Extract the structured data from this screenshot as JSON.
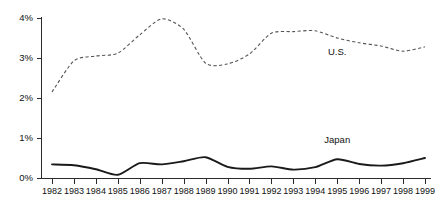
{
  "chart_data": {
    "type": "line",
    "title": "",
    "xlabel": "",
    "ylabel": "",
    "grid": false,
    "legend_position": "inline-annotation",
    "categories": [
      "1982",
      "1983",
      "1984",
      "1985",
      "1986",
      "1987",
      "1988",
      "1989",
      "1990",
      "1991",
      "1992",
      "1993",
      "1994",
      "1995",
      "1996",
      "1997",
      "1998",
      "1999"
    ],
    "x": [
      1982,
      1983,
      1984,
      1985,
      1986,
      1987,
      1988,
      1989,
      1990,
      1991,
      1992,
      1993,
      1994,
      1995,
      1996,
      1997,
      1998,
      1999
    ],
    "ytick_labels": [
      "0%",
      "1%",
      "2%",
      "3%",
      "4%"
    ],
    "ytick_values": [
      0,
      1,
      2,
      3,
      4
    ],
    "ylim": [
      0,
      4
    ],
    "xlim": [
      1982,
      1999
    ],
    "units": "percent",
    "series": [
      {
        "name": "U.S.",
        "style": "dashed",
        "color": "#555555",
        "label_text": "U.S.",
        "values": [
          2.15,
          2.93,
          3.05,
          3.12,
          3.58,
          3.98,
          3.72,
          2.87,
          2.85,
          3.1,
          3.62,
          3.66,
          3.68,
          3.5,
          3.38,
          3.3,
          3.17,
          3.28
        ]
      },
      {
        "name": "Japan",
        "style": "solid",
        "color": "#1a1a1a",
        "label_text": "Japan",
        "values": [
          0.34,
          0.32,
          0.22,
          0.08,
          0.37,
          0.34,
          0.42,
          0.52,
          0.28,
          0.23,
          0.29,
          0.21,
          0.27,
          0.47,
          0.35,
          0.31,
          0.37,
          0.5
        ]
      }
    ],
    "annotations": [
      {
        "text": "U.S.",
        "x": 1995.0,
        "y": 3.08
      },
      {
        "text": "Japan",
        "x": 1995.0,
        "y": 0.88
      }
    ]
  },
  "axes": {
    "y_axis_name": "percent-axis",
    "x_axis_name": "year-axis"
  }
}
